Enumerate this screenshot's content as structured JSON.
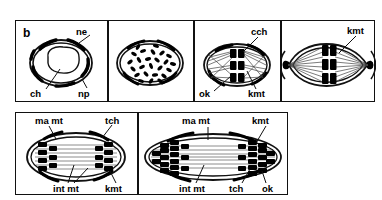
{
  "figure": {
    "panel_letter": "b",
    "colors": {
      "ink": "#111111",
      "background": "#ffffff",
      "chromosome_fill": "#000000",
      "microtubule": "#555555"
    }
  },
  "abbreviations": {
    "ne": "nuclear envelope",
    "ch": "chromatin",
    "np": "nuclear pore",
    "cch": "condensed chromosome",
    "ok": "kinetochore",
    "kmt": "kinetochore microtubule",
    "ma_mt": "astral microtubule",
    "int_mt": "interpolar microtubule",
    "tch": "telophase chromatin"
  },
  "top_row": {
    "panels": [
      {
        "id": "panel-1",
        "stage": "interphase-nucleus",
        "letter": "b",
        "labels": [
          {
            "key": "ne",
            "text": "ne"
          },
          {
            "key": "ch",
            "text": "ch"
          },
          {
            "key": "np",
            "text": "np"
          }
        ]
      },
      {
        "id": "panel-2",
        "stage": "chromosome-condensation",
        "labels": []
      },
      {
        "id": "panel-3",
        "stage": "prometaphase-spindle",
        "labels": [
          {
            "key": "cch",
            "text": "cch"
          },
          {
            "key": "ok",
            "text": "ok"
          },
          {
            "key": "kmt",
            "text": "kmt"
          }
        ]
      },
      {
        "id": "panel-4",
        "stage": "metaphase-bipolar-spindle",
        "labels": [
          {
            "key": "kmt",
            "text": "kmt"
          }
        ]
      }
    ]
  },
  "bottom_row": {
    "panels": [
      {
        "id": "panel-5",
        "stage": "anaphase",
        "labels": [
          {
            "key": "ma_mt",
            "text": "ma mt"
          },
          {
            "key": "tch",
            "text": "tch"
          },
          {
            "key": "int_mt",
            "text": "int mt"
          },
          {
            "key": "kmt",
            "text": "kmt"
          }
        ]
      },
      {
        "id": "panel-6",
        "stage": "late-anaphase-telophase",
        "labels": [
          {
            "key": "ma_mt",
            "text": "ma mt"
          },
          {
            "key": "kmt",
            "text": "kmt"
          },
          {
            "key": "int_mt",
            "text": "int mt"
          },
          {
            "key": "tch",
            "text": "tch"
          },
          {
            "key": "ok",
            "text": "ok"
          }
        ]
      }
    ]
  }
}
